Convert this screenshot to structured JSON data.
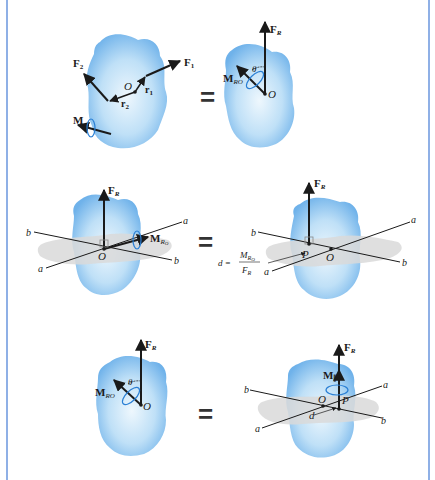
{
  "colors": {
    "frame": "#8fb0e6",
    "body_fill": "#8cc4f0",
    "body_light": "#e6f3fc",
    "plane": "#d8d8d8",
    "vector": "#1a1a1a",
    "moment_loop": "#2a7fd4"
  },
  "equals_sign": "=",
  "panels": [
    {
      "name": "row1-left",
      "labels": {
        "F1": "F",
        "F1_sub": "1",
        "F2": "F",
        "F2_sub": "2",
        "r1": "r",
        "r1_sub": "1",
        "r2": "r",
        "r2_sub": "2",
        "O": "O",
        "M": "M"
      }
    },
    {
      "name": "row1-right",
      "labels": {
        "FR": "F",
        "FR_sub": "R",
        "MRO": "M",
        "MRO_sub": "RO",
        "theta": "θ",
        "O": "O"
      }
    },
    {
      "name": "row2-left",
      "labels": {
        "FR": "F",
        "FR_sub": "R",
        "MRO": "M",
        "MRO_sub": "R",
        "MRO_subsub": "O",
        "O": "O",
        "axis_a": "a",
        "axis_b": "b"
      }
    },
    {
      "name": "row2-right",
      "labels": {
        "FR": "F",
        "FR_sub": "R",
        "P": "P",
        "O": "O",
        "axis_a": "a",
        "axis_b": "b",
        "formula": {
          "d": "d =",
          "num": "M",
          "num_sub": "R",
          "num_subsub": "O",
          "den": "F",
          "den_sub": "R"
        }
      }
    },
    {
      "name": "row3-left",
      "labels": {
        "FR": "F",
        "FR_sub": "R",
        "MRO": "M",
        "MRO_sub": "RO",
        "theta": "θ",
        "O": "O"
      }
    },
    {
      "name": "row3-right",
      "labels": {
        "FR": "F",
        "FR_sub": "R",
        "Mpar": "M",
        "Mpar_sub": "∥",
        "P": "P",
        "O": "O",
        "d": "d",
        "axis_a": "a",
        "axis_b": "b"
      }
    }
  ]
}
